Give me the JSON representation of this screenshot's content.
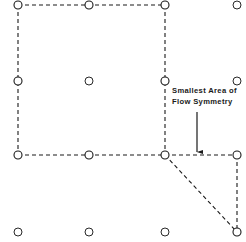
{
  "figure": {
    "width": 246,
    "height": 242,
    "background_color": "#ffffff",
    "ink_color": "#1a1a1a"
  },
  "annotation": {
    "name": "smallest-area-of-flow-symmetry",
    "line_1": "Smallest Area of",
    "line_2": "Flow Symmetry",
    "text_x": 172,
    "text_y": 86,
    "font_size_px": 7.6,
    "font_weight": "bold",
    "leader": {
      "type": "arrow",
      "x1": 197,
      "y1": 112,
      "x2": 197,
      "y2": 152,
      "direction": "down",
      "head_width": 4.2,
      "head_length": 6
    }
  },
  "grid": {
    "description": "Rectangular array of open circles marking well locations",
    "columns_x": [
      18,
      89,
      165,
      237
    ],
    "rows_y": [
      5,
      81,
      155,
      232
    ],
    "node_radius": 4.0,
    "node_stroke_width": 1.1,
    "node_fill": "#ffffff",
    "node_stroke": "#1a1a1a",
    "nodes": [
      {
        "id": "n-r0-c0",
        "x": 18,
        "y": 5,
        "on_boundary": true
      },
      {
        "id": "n-r0-c1",
        "x": 89,
        "y": 5,
        "on_boundary": true
      },
      {
        "id": "n-r0-c2",
        "x": 165,
        "y": 5,
        "on_boundary": true
      },
      {
        "id": "n-r0-c3",
        "x": 237,
        "y": 5,
        "on_boundary": false
      },
      {
        "id": "n-r1-c0",
        "x": 18,
        "y": 81,
        "on_boundary": true
      },
      {
        "id": "n-r1-c1",
        "x": 89,
        "y": 81,
        "on_boundary": false
      },
      {
        "id": "n-r1-c2",
        "x": 165,
        "y": 81,
        "on_boundary": true
      },
      {
        "id": "n-r1-c3",
        "x": 237,
        "y": 81,
        "on_boundary": false
      },
      {
        "id": "n-r2-c0",
        "x": 18,
        "y": 155,
        "on_boundary": true
      },
      {
        "id": "n-r2-c1",
        "x": 89,
        "y": 155,
        "on_boundary": true
      },
      {
        "id": "n-r2-c2",
        "x": 165,
        "y": 155,
        "on_boundary": true
      },
      {
        "id": "n-r2-c3",
        "x": 237,
        "y": 155,
        "on_boundary": true
      },
      {
        "id": "n-r3-c0",
        "x": 18,
        "y": 232,
        "on_boundary": false
      },
      {
        "id": "n-r3-c1",
        "x": 89,
        "y": 232,
        "on_boundary": false
      },
      {
        "id": "n-r3-c2",
        "x": 165,
        "y": 232,
        "on_boundary": false
      },
      {
        "id": "n-r3-c3",
        "x": 237,
        "y": 232,
        "on_boundary": true
      }
    ]
  },
  "boundaries": {
    "stroke": "#1a1a1a",
    "stroke_width": 1.1,
    "dash_pattern": "4 3",
    "segments": [
      {
        "id": "seg-top",
        "x1": 18,
        "y1": 5,
        "x2": 165,
        "y2": 5
      },
      {
        "id": "seg-left",
        "x1": 18,
        "y1": 5,
        "x2": 18,
        "y2": 155
      },
      {
        "id": "seg-middle-vert",
        "x1": 165,
        "y1": 5,
        "x2": 165,
        "y2": 155
      },
      {
        "id": "seg-middle-horiz",
        "x1": 18,
        "y1": 155,
        "x2": 165,
        "y2": 155
      },
      {
        "id": "seg-right-horiz",
        "x1": 165,
        "y1": 155,
        "x2": 237,
        "y2": 155
      },
      {
        "id": "seg-right-vert",
        "x1": 237,
        "y1": 155,
        "x2": 237,
        "y2": 232
      },
      {
        "id": "seg-diagonal",
        "x1": 165,
        "y1": 155,
        "x2": 237,
        "y2": 232
      }
    ]
  },
  "regions": [
    {
      "id": "region-unit-cell",
      "label": "Smallest Area of Flow Symmetry",
      "shape": "rectangle",
      "vertices": [
        [
          18,
          5
        ],
        [
          165,
          5
        ],
        [
          165,
          155
        ],
        [
          18,
          155
        ]
      ]
    },
    {
      "id": "region-triangle",
      "label": "",
      "shape": "triangle",
      "vertices": [
        [
          165,
          155
        ],
        [
          237,
          155
        ],
        [
          237,
          232
        ]
      ]
    }
  ]
}
